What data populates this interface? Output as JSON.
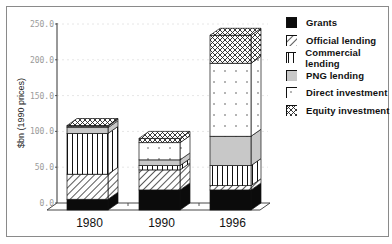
{
  "chart_data": {
    "type": "bar",
    "stacked": true,
    "style": "3d",
    "title": "",
    "xlabel": "",
    "ylabel": "$bn (1990 prices)",
    "ylim": [
      0,
      250
    ],
    "yticks": [
      "0.0",
      "50.0",
      "100.0",
      "150.0",
      "200.0",
      "250.0"
    ],
    "grid": true,
    "legend_position": "right",
    "categories": [
      "1980",
      "1990",
      "1996"
    ],
    "series": [
      {
        "name": "Grants",
        "pattern": "solid-black",
        "values": [
          15,
          28,
          28
        ]
      },
      {
        "name": "Official lending",
        "pattern": "diagonal-hatch",
        "values": [
          35,
          28,
          6
        ]
      },
      {
        "name": "Commercial lending",
        "pattern": "vertical-lines",
        "values": [
          57,
          6,
          28
        ]
      },
      {
        "name": "PNG lending",
        "pattern": "light-gray",
        "values": [
          8,
          8,
          41
        ]
      },
      {
        "name": "Direct investment",
        "pattern": "white-dotted",
        "values": [
          2,
          24,
          102
        ]
      },
      {
        "name": "Equity investment",
        "pattern": "crosshatch",
        "values": [
          1,
          6,
          39
        ]
      }
    ],
    "totals": [
      118,
      100,
      244
    ]
  },
  "colors": {
    "frame": "#8a8a8a",
    "axis": "#333333",
    "grid": "#e6e6e6",
    "gray_fill": "#c8c8c8",
    "black_fill": "#0b0b0b"
  }
}
